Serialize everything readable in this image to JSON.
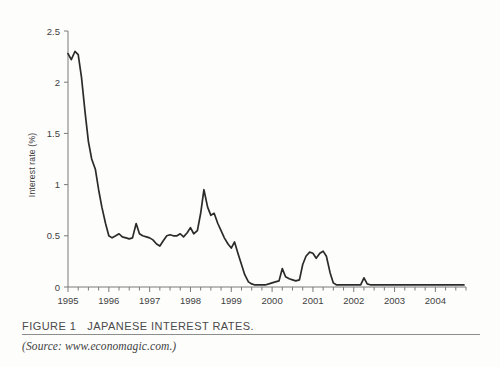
{
  "figure": {
    "label": "FIGURE 1",
    "title": "JAPANESE INTEREST RATES.",
    "source_prefix": "(Source:",
    "source_url": "www.economagic.com.",
    "source_suffix": ")"
  },
  "colors": {
    "line": "#2b2b2b",
    "axis": "#7a7a7a",
    "text": "#3f3f3f",
    "background": "#fdfdfc",
    "rule": "#8d8d8d"
  },
  "chart_data": {
    "type": "line",
    "title": "JAPANESE INTEREST RATES.",
    "xlabel": "",
    "ylabel": "Interest rate (%)",
    "xlim": [
      1995.0,
      2004.75
    ],
    "ylim": [
      0,
      2.5
    ],
    "yticks": [
      0,
      0.5,
      1,
      1.5,
      2,
      2.5
    ],
    "ytick_labels": [
      "0",
      "0.5",
      "1",
      "1.5",
      "2",
      "2.5"
    ],
    "xticks": [
      1995,
      1996,
      1997,
      1998,
      1999,
      2000,
      2001,
      2002,
      2003,
      2004
    ],
    "xtick_labels": [
      "1995",
      "1996",
      "1997",
      "1998",
      "1999",
      "2000",
      "2001",
      "2002",
      "2003",
      "2004"
    ],
    "minor_tick_interval": 0.25,
    "grid": false,
    "legend": null,
    "series": [
      {
        "name": "Japanese interest rate",
        "x": [
          1995.0,
          1995.08,
          1995.17,
          1995.25,
          1995.33,
          1995.42,
          1995.5,
          1995.58,
          1995.67,
          1995.75,
          1995.83,
          1995.92,
          1996.0,
          1996.08,
          1996.17,
          1996.25,
          1996.33,
          1996.42,
          1996.5,
          1996.58,
          1996.67,
          1996.75,
          1996.83,
          1996.92,
          1997.0,
          1997.08,
          1997.17,
          1997.25,
          1997.33,
          1997.42,
          1997.5,
          1997.58,
          1997.67,
          1997.75,
          1997.83,
          1997.92,
          1998.0,
          1998.08,
          1998.17,
          1998.25,
          1998.33,
          1998.42,
          1998.5,
          1998.58,
          1998.67,
          1998.75,
          1998.83,
          1998.92,
          1999.0,
          1999.08,
          1999.17,
          1999.25,
          1999.33,
          1999.42,
          1999.5,
          1999.58,
          1999.67,
          1999.75,
          1999.83,
          1999.92,
          2000.0,
          2000.08,
          2000.17,
          2000.25,
          2000.33,
          2000.42,
          2000.5,
          2000.58,
          2000.67,
          2000.75,
          2000.83,
          2000.92,
          2001.0,
          2001.08,
          2001.17,
          2001.25,
          2001.33,
          2001.42,
          2001.5,
          2001.58,
          2001.67,
          2001.75,
          2001.83,
          2001.92,
          2002.0,
          2002.08,
          2002.17,
          2002.25,
          2002.33,
          2002.42,
          2002.5,
          2002.58,
          2002.67,
          2002.75,
          2002.83,
          2002.92,
          2003.0,
          2003.25,
          2003.5,
          2003.75,
          2004.0,
          2004.25,
          2004.5,
          2004.7
        ],
        "y": [
          2.28,
          2.22,
          2.3,
          2.27,
          2.05,
          1.7,
          1.42,
          1.25,
          1.15,
          0.95,
          0.78,
          0.62,
          0.5,
          0.48,
          0.5,
          0.52,
          0.49,
          0.48,
          0.47,
          0.48,
          0.62,
          0.52,
          0.5,
          0.49,
          0.48,
          0.46,
          0.42,
          0.4,
          0.45,
          0.5,
          0.51,
          0.5,
          0.5,
          0.52,
          0.49,
          0.53,
          0.58,
          0.52,
          0.55,
          0.72,
          0.95,
          0.78,
          0.7,
          0.72,
          0.62,
          0.55,
          0.48,
          0.42,
          0.38,
          0.44,
          0.32,
          0.22,
          0.12,
          0.05,
          0.03,
          0.02,
          0.02,
          0.02,
          0.02,
          0.03,
          0.04,
          0.05,
          0.06,
          0.18,
          0.1,
          0.08,
          0.07,
          0.06,
          0.07,
          0.22,
          0.3,
          0.34,
          0.33,
          0.28,
          0.33,
          0.35,
          0.3,
          0.14,
          0.04,
          0.02,
          0.02,
          0.02,
          0.02,
          0.02,
          0.02,
          0.02,
          0.02,
          0.09,
          0.03,
          0.02,
          0.02,
          0.02,
          0.02,
          0.02,
          0.02,
          0.02,
          0.02,
          0.02,
          0.02,
          0.02,
          0.02,
          0.02,
          0.02,
          0.02
        ]
      }
    ]
  }
}
